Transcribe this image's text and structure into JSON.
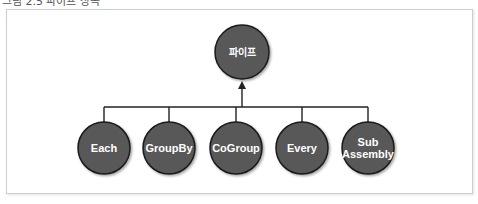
{
  "caption": "그림 2.5 파이프 상속",
  "diagram": {
    "root": {
      "label": "파이프",
      "cx": 242,
      "cy": 52,
      "r": 27
    },
    "children": [
      {
        "label": "Each",
        "lines": [
          "Each"
        ],
        "cx": 104,
        "cy": 148
      },
      {
        "label": "GroupBy",
        "lines": [
          "GroupBy"
        ],
        "cx": 169,
        "cy": 148
      },
      {
        "label": "CoGroup",
        "lines": [
          "CoGroup"
        ],
        "cx": 236,
        "cy": 148
      },
      {
        "label": "Every",
        "lines": [
          "Every"
        ],
        "cx": 302,
        "cy": 148
      },
      {
        "label": "Sub Assembly",
        "lines": [
          "Sub",
          "Assembly"
        ],
        "cx": 368,
        "cy": 148
      }
    ],
    "child_radius": 26,
    "bus_y": 107,
    "colors": {
      "node_fill": "#585858",
      "node_stroke": "#1a1a1a",
      "line": "#222222",
      "label": "#ffffff"
    }
  }
}
